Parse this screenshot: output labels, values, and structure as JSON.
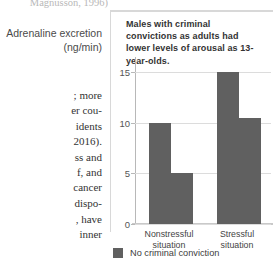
{
  "page": {
    "citation_fragment": "Magnusson, 1996)",
    "body_text_fragment_1": "; more\ner cou-\nidents\n2016).\nss and\nf, and\ncancer\ndispo-",
    "body_text_fragment_2": ", have\ninner"
  },
  "figure": {
    "y_axis_title": "Adrenaline excretion (ng/min)",
    "caption": "Males with criminal convictions as adults had lower levels of arousal as 13-year-olds.",
    "legend": {
      "swatch_color": "#606060",
      "label": "No criminal conviction"
    }
  },
  "chart_data": {
    "type": "bar",
    "title": "Males with criminal convictions as adults had lower levels of arousal as 13-year-olds.",
    "xlabel": "",
    "ylabel": "Adrenaline excretion (ng/min)",
    "categories": [
      "Nonstressful situation",
      "Stressful situation"
    ],
    "category_labels_wrapped": [
      [
        "Nonstressful",
        "situation"
      ],
      [
        "Stressful",
        "situation"
      ]
    ],
    "series": [
      {
        "name": "Criminal conviction",
        "values": [
          10,
          15
        ],
        "color": "#606060"
      },
      {
        "name": "No criminal conviction",
        "values": [
          5,
          10.5
        ],
        "color": "#606060"
      }
    ],
    "ylim": [
      0,
      16.5
    ],
    "yticks": [
      0,
      5,
      10,
      15
    ],
    "ytick_labels": [
      "0",
      "5",
      "10",
      "15"
    ],
    "grid": true,
    "legend_position": "bottom-left",
    "bar_color": "#606060"
  }
}
